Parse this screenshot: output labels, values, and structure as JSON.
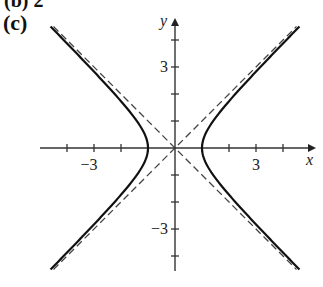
{
  "header": {
    "partial_label": "(b)  2",
    "panel_label": "(c)"
  },
  "chart_data": {
    "type": "line",
    "title": "",
    "xlabel": "x",
    "ylabel": "y",
    "xlim": [
      -5,
      5
    ],
    "ylim": [
      -4.5,
      4.5
    ],
    "grid": false,
    "legend": null,
    "x_ticks": [
      -4,
      -3,
      -2,
      -1,
      1,
      2,
      3,
      4
    ],
    "y_ticks": [
      -4,
      -3,
      -2,
      -1,
      1,
      2,
      3,
      4
    ],
    "x_tick_labels": {
      "-3": "−3",
      "3": "3"
    },
    "y_tick_labels": {
      "3": "3",
      "-3": "−3"
    },
    "series": [
      {
        "name": "hyperbola x^2 - y^2 = 1",
        "style": "solid",
        "equation": "x^2 - y^2 = 1",
        "vertices": [
          [
            -1,
            0
          ],
          [
            1,
            0
          ]
        ]
      },
      {
        "name": "asymptote y = x",
        "style": "dashed",
        "equation": "y = x"
      },
      {
        "name": "asymptote y = -x",
        "style": "dashed",
        "equation": "y = -x"
      }
    ],
    "annotations": []
  },
  "render": {
    "origin_px": [
      175,
      148
    ],
    "unit_px": 27,
    "y_extent": 4.5,
    "curve_color": "#111111",
    "axis_color": "#333333",
    "dash_color": "#444444"
  }
}
